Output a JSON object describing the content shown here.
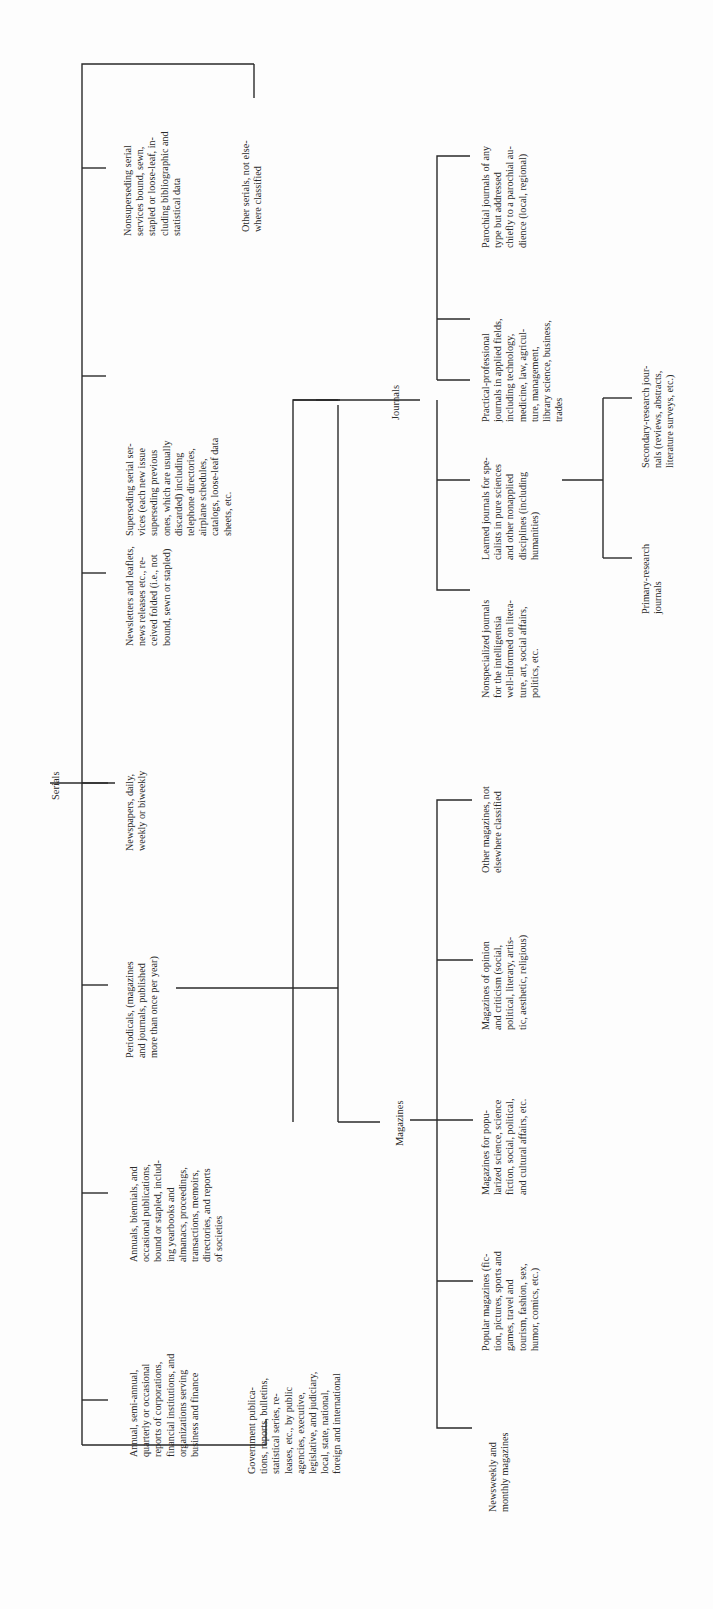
{
  "diagram": {
    "orientation": "rotated-90-ccw",
    "root": {
      "label": "Serials"
    },
    "level1": [
      {
        "id": "nonsuperseding",
        "lines": [
          "Nonsuperseding serial",
          "services bound, sewn,",
          "stapled or loose-leaf, in-",
          "cluding bibliographic and",
          "statistical data"
        ]
      },
      {
        "id": "other-serials",
        "lines": [
          "Other serials, not else-",
          "where classified"
        ]
      },
      {
        "id": "superseding",
        "lines": [
          "Superseding serial ser-",
          "vices (each new issue",
          "superseding previous",
          "ones, which are usually",
          "discarded) including",
          "telephone directories,",
          "airplane schedules,",
          "catalogs, loose-leaf data",
          "sheets, etc."
        ]
      },
      {
        "id": "newsletters",
        "lines": [
          "Newsletters and leaflets,",
          "news releases etc., re-",
          "ceived folded (i.e., not",
          "bound, sewn or stapled)"
        ]
      },
      {
        "id": "newspapers",
        "lines": [
          "Newspapers, daily,",
          "weekly or biweekly"
        ]
      },
      {
        "id": "periodicals",
        "lines": [
          "Periodicals, (magazines",
          "and journals, published",
          "more than once per year)"
        ]
      },
      {
        "id": "annuals",
        "lines": [
          "Annuals, biennials, and",
          "occasional publications,",
          "bound or stapled, includ-",
          "ing yearbooks and",
          "almanacs, proceedings,",
          "transactions, memoirs,",
          "directories, and reports",
          "of societies"
        ]
      },
      {
        "id": "annual-reports",
        "lines": [
          "Annual, semi-annual,",
          "quarterly or occasional",
          "reports of corporations,",
          "financial institutions, and",
          "organizations serving",
          "business and finance"
        ]
      },
      {
        "id": "government",
        "lines": [
          "Government publica-",
          "tions, reports, bulletins,",
          "statistical series, re-",
          "leases, etc., by public",
          "agencies, executive,",
          "legislative, and judiciary,",
          "local, state, national,",
          "foreign and international"
        ]
      }
    ],
    "periodicals_children": {
      "journals": {
        "label": "Journals",
        "children": [
          {
            "id": "parochial",
            "lines": [
              "Parochial journals of any",
              "type but addressed",
              "chiefly to a parochial au-",
              "dience (local, regional)"
            ]
          },
          {
            "id": "practical",
            "lines": [
              "Practical-professional",
              "journals in applied fields,",
              "including technology,",
              "medicine, law, agricul-",
              "ture, management,",
              "library science, business,",
              "trades"
            ]
          },
          {
            "id": "learned",
            "lines": [
              "Learned journals for spe-",
              "cialists in pure sciences",
              "and other nonapplied",
              "disciplines (including",
              "humanities)"
            ]
          },
          {
            "id": "nonspecialized",
            "lines": [
              "Nonspecialized journals",
              "for the intelligentsia",
              "well-informed on litera-",
              "ture, art, social affairs,",
              "politics, etc."
            ]
          }
        ],
        "learned_children": [
          {
            "id": "secondary",
            "lines": [
              "Secondary-research jour-",
              "nals (reviews, abstracts,",
              "literature surveys, etc.)"
            ]
          },
          {
            "id": "primary",
            "lines": [
              "Primary-research",
              "journals"
            ]
          }
        ]
      },
      "magazines": {
        "label": "Magazines",
        "children": [
          {
            "id": "other-mag",
            "lines": [
              "Other magazines, not",
              "elsewhere classified"
            ]
          },
          {
            "id": "opinion",
            "lines": [
              "Magazines of opinion",
              "and criticism (social,",
              "political, literary, artis-",
              "tic, aesthetic, religious)"
            ]
          },
          {
            "id": "popularized",
            "lines": [
              "Magazines for popu-",
              "larized science, science",
              "fiction, social, political,",
              "and cultural affairs, etc."
            ]
          },
          {
            "id": "popular",
            "lines": [
              "Popular magazines (fic-",
              "tion, pictures, sports and",
              "games, travel and",
              "tourism, fashion, sex,",
              "humor, comics, etc.)"
            ]
          },
          {
            "id": "newsweekly",
            "lines": [
              "Newsweekly and",
              "monthly magazines"
            ]
          }
        ]
      }
    }
  }
}
